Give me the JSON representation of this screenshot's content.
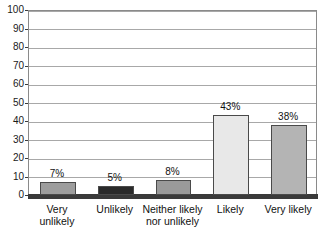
{
  "chart_data": {
    "type": "bar",
    "title": "",
    "xlabel": "",
    "ylabel": "",
    "ylim": [
      0,
      100
    ],
    "ytick_step": 10,
    "grid": true,
    "legend": "none",
    "categories": [
      "Very\nunlikely",
      "Unlikely",
      "Neither likely\nnor unlikely",
      "Likely",
      "Very likely"
    ],
    "values": [
      7,
      5,
      8,
      43,
      38
    ],
    "data_labels": [
      "7%",
      "5%",
      "8%",
      "43%",
      "38%"
    ],
    "yticks": [
      "0",
      "10",
      "20",
      "30",
      "40",
      "50",
      "60",
      "70",
      "80",
      "90",
      "100"
    ],
    "bar_colors": [
      "#9d9d9d",
      "#2a2a2a",
      "#9a9a9a",
      "#e8e8e8",
      "#b4b4b4"
    ],
    "bar_border_color": "#4a4a4a",
    "gridline_color": "#a8a8a8",
    "axis_color": "#3a3a3a",
    "plot_background": "#ffffff"
  },
  "meta": {
    "title_partial": ""
  }
}
